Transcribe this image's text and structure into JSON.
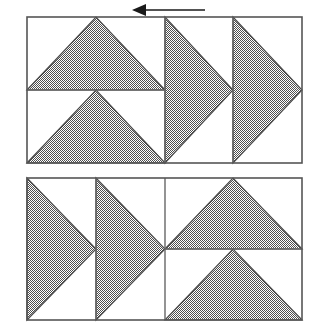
{
  "figure": {
    "background_color": "#ffffff",
    "shade_color": "#8a8a8a",
    "shade_pattern": "50-percent-dither-gray",
    "outline_color": "#555555",
    "arrow_color": "#1a1a1a"
  },
  "arrow": {
    "name": "translation-arrow",
    "direction": "left",
    "label": "",
    "shaft_x_start": 205,
    "shaft_x_end": 143,
    "shaft_y": 10,
    "head_tip_x": 132,
    "head_tip_y": 10,
    "head_half_height": 6,
    "head_length": 14
  },
  "panels": [
    {
      "name": "top-panel",
      "x": 27,
      "y": 17,
      "width": 275,
      "height": 146,
      "cells": [
        {
          "name": "cell-top-left-upper",
          "x": 27,
          "y": 17,
          "width": 138,
          "height": 73,
          "triangle": "up",
          "triangle_points": "27,90 165,90 96,17"
        },
        {
          "name": "cell-top-left-lower",
          "x": 27,
          "y": 90,
          "width": 138,
          "height": 73,
          "triangle": "up",
          "triangle_points": "27,163 165,163 96,90"
        },
        {
          "name": "cell-top-middle",
          "x": 165,
          "y": 17,
          "width": 68,
          "height": 146,
          "triangle": "right",
          "triangle_points": "165,17 165,163 233,90"
        },
        {
          "name": "cell-top-right",
          "x": 233,
          "y": 17,
          "width": 69,
          "height": 146,
          "triangle": "right",
          "triangle_points": "233,17 233,163 302,90"
        }
      ],
      "dividers": [
        {
          "name": "divider-top-vertical-1",
          "x1": 165,
          "y1": 17,
          "x2": 165,
          "y2": 163
        },
        {
          "name": "divider-top-vertical-2",
          "x1": 233,
          "y1": 17,
          "x2": 233,
          "y2": 163
        },
        {
          "name": "divider-top-horizontal-1",
          "x1": 27,
          "y1": 90,
          "x2": 165,
          "y2": 90
        }
      ]
    },
    {
      "name": "bottom-panel",
      "x": 27,
      "y": 178,
      "width": 275,
      "height": 142,
      "cells": [
        {
          "name": "cell-bottom-left",
          "x": 27,
          "y": 178,
          "width": 69,
          "height": 142,
          "triangle": "right",
          "triangle_points": "27,178 27,320 96,249"
        },
        {
          "name": "cell-bottom-middle",
          "x": 96,
          "y": 178,
          "width": 69,
          "height": 142,
          "triangle": "right",
          "triangle_points": "96,178 96,320 165,249"
        },
        {
          "name": "cell-bottom-right-upper",
          "x": 165,
          "y": 178,
          "width": 137,
          "height": 71,
          "triangle": "up",
          "triangle_points": "165,249 302,249 233,178"
        },
        {
          "name": "cell-bottom-right-lower",
          "x": 165,
          "y": 249,
          "width": 137,
          "height": 71,
          "triangle": "up",
          "triangle_points": "165,320 302,320 233,249"
        }
      ],
      "dividers": [
        {
          "name": "divider-bottom-vertical-1",
          "x1": 96,
          "y1": 178,
          "x2": 96,
          "y2": 320
        },
        {
          "name": "divider-bottom-vertical-2",
          "x1": 165,
          "y1": 178,
          "x2": 165,
          "y2": 320
        },
        {
          "name": "divider-bottom-horizontal-1",
          "x1": 165,
          "y1": 249,
          "x2": 302,
          "y2": 249
        }
      ]
    }
  ]
}
